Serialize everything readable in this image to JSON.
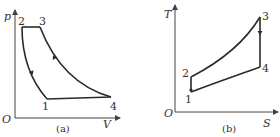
{
  "diagrams": [
    {
      "id": "pv",
      "caption": "(a)",
      "axes": {
        "x_label": "V",
        "y_label": "p",
        "origin_label": "O"
      },
      "points": [
        {
          "label": "1"
        },
        {
          "label": "2"
        },
        {
          "label": "3"
        },
        {
          "label": "4"
        }
      ],
      "processes": [
        {
          "from": "1",
          "to": "2",
          "type": "adiabatic compression",
          "arrow": "up"
        },
        {
          "from": "2",
          "to": "3",
          "type": "isobaric heat addition"
        },
        {
          "from": "3",
          "to": "4",
          "type": "adiabatic expansion",
          "arrow": "down"
        },
        {
          "from": "4",
          "to": "1",
          "type": "isochoric heat rejection"
        }
      ]
    },
    {
      "id": "ts",
      "caption": "(b)",
      "axes": {
        "x_label": "S",
        "y_label": "T",
        "origin_label": "O"
      },
      "points": [
        {
          "label": "1"
        },
        {
          "label": "2"
        },
        {
          "label": "3"
        },
        {
          "label": "4"
        }
      ],
      "processes": [
        {
          "from": "1",
          "to": "2",
          "type": "isentropic"
        },
        {
          "from": "2",
          "to": "3",
          "type": "heat addition curve"
        },
        {
          "from": "3",
          "to": "4",
          "type": "isentropic",
          "arrow": "down"
        },
        {
          "from": "4",
          "to": "1",
          "type": "heat rejection curve"
        }
      ]
    }
  ],
  "colors": {
    "line": "#2a2a2a",
    "text": "#333333"
  }
}
